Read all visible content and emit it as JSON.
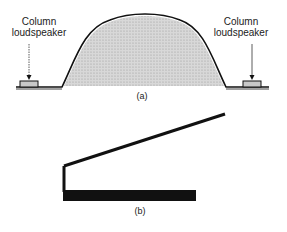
{
  "figure_a": {
    "left_label_line1": "Column",
    "left_label_line2": "loudspeaker",
    "right_label_line1": "Column",
    "right_label_line2": "loudspeaker",
    "caption": "(a)"
  },
  "figure_b": {
    "caption": "(b)"
  },
  "colors": {
    "ink": "#111111",
    "fill": "#cfcfcf"
  }
}
